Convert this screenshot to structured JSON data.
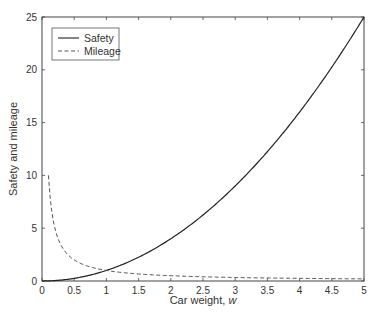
{
  "chart_data": {
    "type": "line",
    "title": "",
    "xlabel": "Car weight, ",
    "xlabel_italic": "w",
    "ylabel": "Safety and mileage",
    "xlim": [
      0,
      5
    ],
    "ylim": [
      0,
      25
    ],
    "xticks": [
      0,
      0.5,
      1,
      1.5,
      2,
      2.5,
      3,
      3.5,
      4,
      4.5,
      5
    ],
    "xtick_labels": [
      "0",
      "0.5",
      "1",
      "1.5",
      "2",
      "2.5",
      "3",
      "3.5",
      "4",
      "4.5",
      "5"
    ],
    "yticks": [
      0,
      5,
      10,
      15,
      20,
      25
    ],
    "ytick_labels": [
      "0",
      "5",
      "10",
      "15",
      "20",
      "25"
    ],
    "grid": false,
    "legend_position": "upper left",
    "series": [
      {
        "name": "Safety",
        "style": "solid",
        "color": "#222222",
        "formula": "w^2",
        "x": [
          0,
          0.5,
          1,
          1.5,
          2,
          2.5,
          3,
          3.5,
          4,
          4.5,
          5
        ],
        "values": [
          0,
          0.25,
          1,
          2.25,
          4,
          6.25,
          9,
          12.25,
          16,
          20.25,
          25
        ]
      },
      {
        "name": "Mileage",
        "style": "dashed",
        "color": "#555555",
        "formula": "1/w",
        "x": [
          0.1,
          0.2,
          0.3,
          0.5,
          1,
          1.5,
          2,
          2.5,
          3,
          3.5,
          4,
          4.5,
          5
        ],
        "values": [
          10,
          5,
          3.33,
          2,
          1,
          0.67,
          0.5,
          0.4,
          0.33,
          0.29,
          0.25,
          0.22,
          0.2
        ]
      }
    ]
  },
  "legend": {
    "items": [
      {
        "label": "Safety",
        "style": "solid"
      },
      {
        "label": "Mileage",
        "style": "dashed"
      }
    ]
  }
}
